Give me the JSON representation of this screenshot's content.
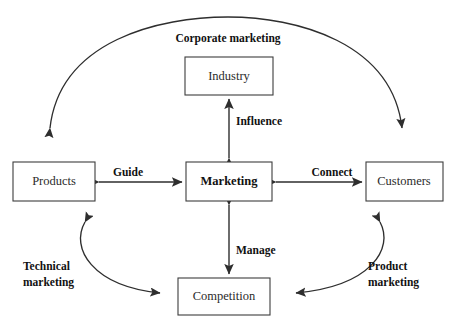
{
  "diagram": {
    "background_color": "#ffffff",
    "line_color": "#2e2e2e",
    "box_border_color": "#3d3d3d",
    "text_color": "#1a1a1a",
    "nodes": [
      {
        "id": "industry",
        "label": "Industry",
        "bold": false,
        "x": 185,
        "y": 57,
        "w": 88,
        "h": 38
      },
      {
        "id": "products",
        "label": "Products",
        "bold": false,
        "x": 13,
        "y": 162,
        "w": 82,
        "h": 39
      },
      {
        "id": "marketing",
        "label": "Marketing",
        "bold": true,
        "x": 186,
        "y": 162,
        "w": 86,
        "h": 39
      },
      {
        "id": "customers",
        "label": "Customers",
        "bold": false,
        "x": 366,
        "y": 162,
        "w": 77,
        "h": 39
      },
      {
        "id": "competition",
        "label": "Competition",
        "bold": false,
        "x": 178,
        "y": 278,
        "w": 92,
        "h": 37
      }
    ],
    "edges": [
      {
        "id": "influence",
        "label": "Influence",
        "from": "marketing",
        "to": "industry",
        "style": "straight-double"
      },
      {
        "id": "guide",
        "label": "Guide",
        "from": "products",
        "to": "marketing",
        "style": "straight-double"
      },
      {
        "id": "connect",
        "label": "Connect",
        "from": "marketing",
        "to": "customers",
        "style": "straight-double"
      },
      {
        "id": "manage",
        "label": "Manage",
        "from": "marketing",
        "to": "competition",
        "style": "straight-double"
      },
      {
        "id": "corporate-marketing",
        "label": "Corporate marketing",
        "from": "products",
        "to": "customers",
        "style": "arc-double"
      },
      {
        "id": "technical-marketing",
        "label_line1": "Technical",
        "label_line2": "marketing",
        "from": "products",
        "to": "competition",
        "style": "arc-double"
      },
      {
        "id": "product-marketing",
        "label_line1": "Product",
        "label_line2": "marketing",
        "from": "customers",
        "to": "competition",
        "style": "arc-double"
      }
    ],
    "labels": {
      "corporate_marketing": "Corporate marketing",
      "influence": "Influence",
      "guide": "Guide",
      "connect": "Connect",
      "manage": "Manage",
      "technical_marketing_line1": "Technical",
      "technical_marketing_line2": "marketing",
      "product_marketing_line1": "Product",
      "product_marketing_line2": "marketing"
    }
  }
}
